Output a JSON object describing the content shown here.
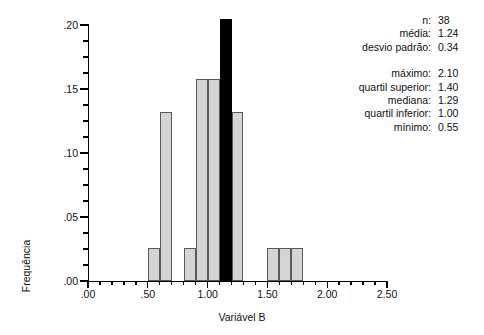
{
  "chart_data": {
    "type": "bar",
    "title": "",
    "xlabel": "Variável B",
    "ylabel": "Frequência",
    "xlim": [
      0.0,
      2.5
    ],
    "ylim": [
      0.0,
      0.2
    ],
    "xticks": [
      ".00",
      ".50",
      "1.00",
      "1.50",
      "2.00",
      "2.50"
    ],
    "xtick_values": [
      0.0,
      0.5,
      1.0,
      1.5,
      2.0,
      2.5
    ],
    "yticks": [
      ".00",
      ".05",
      ".10",
      ".15",
      ".20"
    ],
    "ytick_values": [
      0.0,
      0.05,
      0.1,
      0.15,
      0.2
    ],
    "xtick_minor_step": 0.1,
    "ytick_minor_step": 0.0125,
    "grid": false,
    "legend": null,
    "bin_width": 0.1,
    "bars": [
      {
        "bin_start": 0.5,
        "bin_end": 0.6,
        "value": 0.026,
        "highlight": false
      },
      {
        "bin_start": 0.6,
        "bin_end": 0.7,
        "value": 0.132,
        "highlight": false
      },
      {
        "bin_start": 0.8,
        "bin_end": 0.9,
        "value": 0.026,
        "highlight": false
      },
      {
        "bin_start": 0.9,
        "bin_end": 1.0,
        "value": 0.158,
        "highlight": false
      },
      {
        "bin_start": 1.0,
        "bin_end": 1.1,
        "value": 0.158,
        "highlight": false
      },
      {
        "bin_start": 1.1,
        "bin_end": 1.2,
        "value": 0.205,
        "highlight": true
      },
      {
        "bin_start": 1.2,
        "bin_end": 1.3,
        "value": 0.132,
        "highlight": false
      },
      {
        "bin_start": 1.5,
        "bin_end": 1.6,
        "value": 0.026,
        "highlight": false
      },
      {
        "bin_start": 1.6,
        "bin_end": 1.7,
        "value": 0.026,
        "highlight": false
      },
      {
        "bin_start": 1.7,
        "bin_end": 1.8,
        "value": 0.026,
        "highlight": false
      }
    ],
    "colors": {
      "bar": "#d4d4d4",
      "bar_edge": "#5a5a5a",
      "highlight": "#000000",
      "axis": "#000000"
    }
  },
  "stats": {
    "group_a": [
      {
        "label": "n:",
        "value": "38"
      },
      {
        "label": "média:",
        "value": "1.24"
      },
      {
        "label": "desvio padrão:",
        "value": "0.34"
      }
    ],
    "group_b": [
      {
        "label": "máximo:",
        "value": "2.10"
      },
      {
        "label": "quartil superior:",
        "value": "1.40"
      },
      {
        "label": "mediana:",
        "value": "1.29"
      },
      {
        "label": "quartil inferior:",
        "value": "1.00"
      },
      {
        "label": "mínimo:",
        "value": "0.55"
      }
    ]
  }
}
